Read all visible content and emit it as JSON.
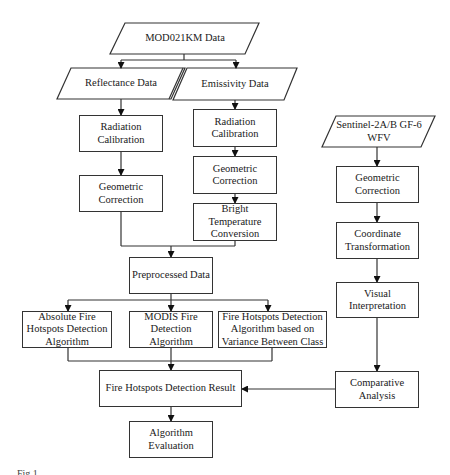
{
  "diagram": {
    "type": "flowchart",
    "nodes": {
      "mod021km": "MOD021KM Data",
      "reflectance": "Reflectance Data",
      "emissivity": "Emissivity Data",
      "rad_cal_left": "Radiation Calibration",
      "geo_corr_left": "Geometric Correction",
      "rad_cal_right": "Radiation Calibration",
      "geo_corr_right": "Geometric Correction",
      "bright_temp": "Bright Temperature Conversion",
      "preprocessed": "Preprocessed Data",
      "absolute_algo": "Absolute Fire Hotspots Detection Algorithm",
      "modis_algo": "MODIS Fire Detection Algorithm",
      "variance_algo": "Fire Hotspots Detection Algorithm based on Variance Between Class",
      "result": "Fire Hotspots Detection Result",
      "evaluation": "Algorithm Evaluation",
      "sentinel": "Sentinel-2A/B GF-6 WFV",
      "geo_corr_sentinel": "Geometric Correction",
      "coord_transform": "Coordinate Transformation",
      "visual_interp": "Visual Interpretation",
      "comparative": "Comparative Analysis"
    },
    "edges": [
      [
        "mod021km",
        "reflectance"
      ],
      [
        "mod021km",
        "emissivity"
      ],
      [
        "reflectance",
        "rad_cal_left"
      ],
      [
        "rad_cal_left",
        "geo_corr_left"
      ],
      [
        "emissivity",
        "rad_cal_right"
      ],
      [
        "rad_cal_right",
        "geo_corr_right"
      ],
      [
        "geo_corr_right",
        "bright_temp"
      ],
      [
        "geo_corr_left",
        "preprocessed"
      ],
      [
        "bright_temp",
        "preprocessed"
      ],
      [
        "preprocessed",
        "absolute_algo"
      ],
      [
        "preprocessed",
        "modis_algo"
      ],
      [
        "preprocessed",
        "variance_algo"
      ],
      [
        "absolute_algo",
        "result"
      ],
      [
        "modis_algo",
        "result"
      ],
      [
        "variance_algo",
        "result"
      ],
      [
        "result",
        "evaluation"
      ],
      [
        "sentinel",
        "geo_corr_sentinel"
      ],
      [
        "geo_corr_sentinel",
        "coord_transform"
      ],
      [
        "coord_transform",
        "visual_interp"
      ],
      [
        "visual_interp",
        "comparative"
      ],
      [
        "comparative",
        "result"
      ]
    ],
    "caption": "Fig.1"
  }
}
